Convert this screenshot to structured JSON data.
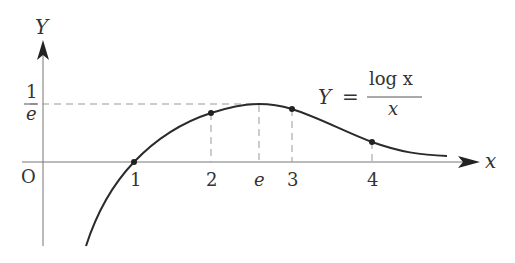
{
  "diagram": {
    "function_label": {
      "lhs": "Y",
      "equals": "=",
      "numerator": "log x",
      "denominator": "x"
    },
    "axes": {
      "x_label": "x",
      "y_label": "Y",
      "origin_label": "O"
    },
    "x_ticks": [
      "1",
      "2",
      "e",
      "3",
      "4"
    ],
    "y_tick": {
      "numerator": "1",
      "denominator": "e"
    },
    "marked_points": [
      {
        "x": "1",
        "y": "0"
      },
      {
        "x": "2",
        "y": "log 2 / 2"
      },
      {
        "x": "3",
        "y": "log 3 / 3"
      },
      {
        "x": "4",
        "y": "log 4 / 4"
      }
    ],
    "maximum": {
      "x": "e",
      "y": "1/e"
    },
    "colors": {
      "curve": "#2b2b2b",
      "axis": "#777777",
      "dashed": "#999999"
    }
  }
}
